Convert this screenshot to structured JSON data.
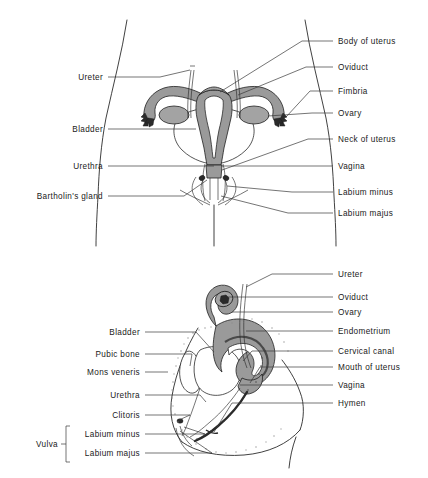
{
  "figure": {
    "background_color": "#ffffff",
    "ink_color": "#2b2b2b",
    "organ_fill_color": "#9a9a9a",
    "panels": [
      {
        "id": "anterior-view",
        "name": "female-reproductive-anterior-view",
        "labels_left": [
          {
            "text": "Ureter",
            "x": 103,
            "y": 80,
            "line_x1": 108,
            "line_x2": 160,
            "line_y": 77
          },
          {
            "text": "Bladder",
            "x": 103,
            "y": 132,
            "line_x1": 108,
            "line_x2": 196,
            "line_y": 129
          },
          {
            "text": "Urethra",
            "x": 103,
            "y": 169,
            "line_x1": 108,
            "line_x2": 214,
            "line_y": 166
          },
          {
            "text": "Bartholin's gland",
            "x": 103,
            "y": 199,
            "line_x1": 108,
            "line_x2": 205,
            "line_y": 196
          }
        ],
        "labels_right": [
          {
            "text": "Body of uterus",
            "x": 338,
            "y": 44,
            "line_x1": 333,
            "line_x2": 302,
            "line_y": 41
          },
          {
            "text": "Oviduct",
            "x": 338,
            "y": 70,
            "line_x1": 333,
            "line_x2": 306,
            "line_y": 67
          },
          {
            "text": "Fimbria",
            "x": 338,
            "y": 94,
            "line_x1": 333,
            "line_x2": 310,
            "line_y": 91
          },
          {
            "text": "Ovary",
            "x": 338,
            "y": 116,
            "line_x1": 333,
            "line_x2": 312,
            "line_y": 113
          },
          {
            "text": "Neck of uterus",
            "x": 338,
            "y": 142,
            "line_x1": 333,
            "line_x2": 308,
            "line_y": 139
          },
          {
            "text": "Vagina",
            "x": 338,
            "y": 169,
            "line_x1": 333,
            "line_x2": 300,
            "line_y": 166
          },
          {
            "text": "Labium minus",
            "x": 338,
            "y": 195,
            "line_x1": 333,
            "line_x2": 292,
            "line_y": 192
          },
          {
            "text": "Labium majus",
            "x": 338,
            "y": 216,
            "line_x1": 333,
            "line_x2": 288,
            "line_y": 213
          }
        ]
      },
      {
        "id": "sagittal-view",
        "name": "female-reproductive-sagittal-view",
        "labels_left": [
          {
            "text": "Bladder",
            "x": 140,
            "y": 335,
            "line_x1": 145,
            "line_x2": 196,
            "line_y": 332
          },
          {
            "text": "Pubic bone",
            "x": 140,
            "y": 357,
            "line_x1": 145,
            "line_x2": 192,
            "line_y": 354
          },
          {
            "text": "Mons veneris",
            "x": 140,
            "y": 375,
            "line_x1": 145,
            "line_x2": 168,
            "line_y": 372
          },
          {
            "text": "Urethra",
            "x": 140,
            "y": 398,
            "line_x1": 145,
            "line_x2": 200,
            "line_y": 395
          },
          {
            "text": "Clitoris",
            "x": 140,
            "y": 418,
            "line_x1": 145,
            "line_x2": 190,
            "line_y": 415
          },
          {
            "text": "Labium minus",
            "x": 140,
            "y": 437,
            "line_x1": 145,
            "line_x2": 205,
            "line_y": 434
          },
          {
            "text": "Labium majus",
            "x": 140,
            "y": 456,
            "line_x1": 145,
            "line_x2": 212,
            "line_y": 453
          }
        ],
        "labels_right": [
          {
            "text": "Ureter",
            "x": 338,
            "y": 277,
            "line_x1": 333,
            "line_x2": 272,
            "line_y": 274
          },
          {
            "text": "Oviduct",
            "x": 338,
            "y": 300,
            "line_x1": 333,
            "line_x2": 228,
            "line_y": 297
          },
          {
            "text": "Ovary",
            "x": 338,
            "y": 315,
            "line_x1": 333,
            "line_x2": 232,
            "line_y": 312
          },
          {
            "text": "Endometrium",
            "x": 338,
            "y": 334,
            "line_x1": 333,
            "line_x2": 246,
            "line_y": 331
          },
          {
            "text": "Cervical canal",
            "x": 338,
            "y": 354,
            "line_x1": 333,
            "line_x2": 252,
            "line_y": 351
          },
          {
            "text": "Mouth of uterus",
            "x": 338,
            "y": 370,
            "line_x1": 333,
            "line_x2": 260,
            "line_y": 367
          },
          {
            "text": "Vagina",
            "x": 338,
            "y": 388,
            "line_x1": 333,
            "line_x2": 240,
            "line_y": 385
          },
          {
            "text": "Hymen",
            "x": 338,
            "y": 406,
            "line_x1": 333,
            "line_x2": 232,
            "line_y": 403
          }
        ],
        "group_label": {
          "text": "Vulva",
          "x": 58,
          "y": 447
        }
      }
    ]
  }
}
